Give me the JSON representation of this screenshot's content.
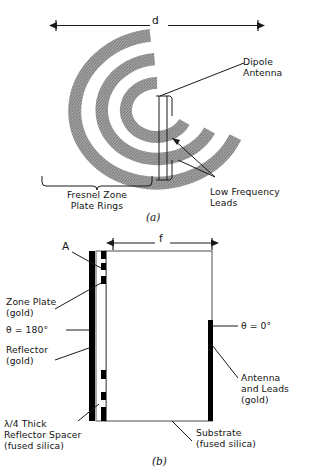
{
  "figure": {
    "panel_a": {
      "caption": "(a)",
      "dimension_label": "d",
      "rings_label_line1": "Fresnel Zone",
      "rings_label_line2": "Plate Rings",
      "dipole_label_line1": "Dipole",
      "dipole_label_line2": "Antenna",
      "leads_label_line1": "Low Frequency",
      "leads_label_line2": "Leads",
      "ring_color": "#9a9a9a",
      "ring_count": 3,
      "rings": [
        {
          "name": "outer-ring",
          "rx": 84,
          "ry": 74,
          "thickness": 14
        },
        {
          "name": "middle-ring",
          "rx": 58,
          "ry": 51,
          "thickness": 13
        },
        {
          "name": "inner-ring",
          "rx": 32,
          "ry": 28,
          "thickness": 12
        }
      ]
    },
    "panel_b": {
      "caption": "(b)",
      "dimension_label": "f",
      "point_label": "A",
      "zone_plate_line1": "Zone Plate",
      "zone_plate_line2": "(gold)",
      "theta_180": "θ = 180°",
      "reflector_line1": "Reflector",
      "reflector_line2": "(gold)",
      "spacer_line1": "λ/4 Thick",
      "spacer_line2": "Reflector Spacer",
      "spacer_line3": "(fused silica)",
      "theta_0": "θ = 0°",
      "antenna_line1": "Antenna",
      "antenna_line2": "and Leads",
      "antenna_line3": "(gold)",
      "substrate_line1": "Substrate",
      "substrate_line2": "(fused silica)",
      "gold_color": "#000000",
      "outline_color": "#1a1a1a",
      "zone_plate_segments": [
        {
          "name": "seg-1",
          "y": 263,
          "h": 7
        },
        {
          "name": "seg-2",
          "y": 276,
          "h": 8
        },
        {
          "name": "seg-3",
          "y": 370,
          "h": 9
        },
        {
          "name": "seg-4",
          "y": 392,
          "h": 8
        },
        {
          "name": "seg-5",
          "y": 407,
          "h": 7
        }
      ]
    }
  }
}
